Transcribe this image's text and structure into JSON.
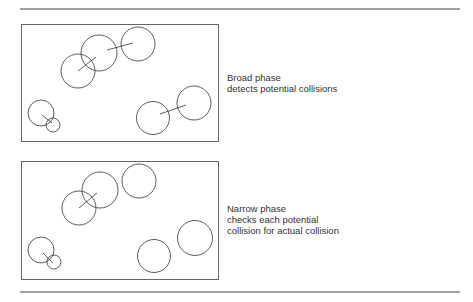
{
  "panels": [
    {
      "name": "broad-phase",
      "caption": [
        "Broad phase",
        "detects potential collisions"
      ],
      "circles": [
        {
          "cx": 78,
          "cy": 71,
          "r": 17
        },
        {
          "cx": 99,
          "cy": 53,
          "r": 18
        },
        {
          "cx": 138,
          "cy": 44,
          "r": 17
        },
        {
          "cx": 41,
          "cy": 113,
          "r": 13
        },
        {
          "cx": 53,
          "cy": 125,
          "r": 7
        },
        {
          "cx": 153,
          "cy": 118,
          "r": 16.5
        },
        {
          "cx": 194,
          "cy": 103,
          "r": 17
        }
      ],
      "links": [
        {
          "x1": 78,
          "y1": 71,
          "x2": 96,
          "y2": 57
        },
        {
          "x1": 107,
          "y1": 50,
          "x2": 133,
          "y2": 43
        },
        {
          "x1": 42,
          "y1": 115,
          "x2": 52,
          "y2": 123
        },
        {
          "x1": 160,
          "y1": 114,
          "x2": 186,
          "y2": 105
        }
      ]
    },
    {
      "name": "narrow-phase",
      "caption": [
        "Narrow phase",
        "checks each potential",
        "collision for actual collision"
      ],
      "circles": [
        {
          "cx": 79,
          "cy": 208,
          "r": 17
        },
        {
          "cx": 100,
          "cy": 190,
          "r": 18
        },
        {
          "cx": 139,
          "cy": 181,
          "r": 17
        },
        {
          "cx": 41,
          "cy": 250,
          "r": 13
        },
        {
          "cx": 54,
          "cy": 262,
          "r": 7
        },
        {
          "cx": 154,
          "cy": 256,
          "r": 16.5
        },
        {
          "cx": 195,
          "cy": 238,
          "r": 17.5
        }
      ],
      "links": [
        {
          "x1": 79,
          "y1": 208,
          "x2": 97,
          "y2": 193
        },
        {
          "x1": 43,
          "y1": 253,
          "x2": 53,
          "y2": 263
        }
      ]
    }
  ],
  "colors": {
    "stroke": "#333333",
    "rule": "#444444"
  }
}
